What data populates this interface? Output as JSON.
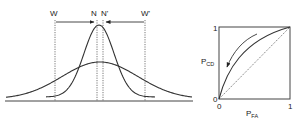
{
  "left_panel": {
    "threshold_labels": {
      "w": "W",
      "n": "N",
      "n_prime": "N'",
      "w_prime": "W'"
    },
    "curves": [
      "narrow-gaussian",
      "wide-gaussian"
    ]
  },
  "roc_panel": {
    "y_axis_label": "P",
    "y_axis_subscript": "CD",
    "x_axis_label": "P",
    "x_axis_subscript": "FA",
    "y_tick_top": "1",
    "y_tick_bottom": "0",
    "x_tick_left": "0",
    "x_tick_right": "1"
  }
}
